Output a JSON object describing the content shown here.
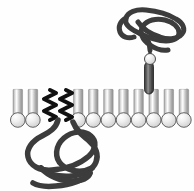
{
  "figure": {
    "width": 194,
    "height": 191,
    "background_color": "#fefefe"
  },
  "membrane": {
    "label": "phospholipid-bilayer",
    "left_x": 10,
    "right_x": 186,
    "top_y": 52,
    "bottom_y": 128,
    "midline_y": 88,
    "lipid_spacing": 15.1,
    "lipid_count_per_leaflet": 12,
    "head_radius": 7.3,
    "head_fill": "#e8e8e8",
    "head_edge": "#555555",
    "tail_fill": "#b9b9b9",
    "tail_edge": "#8a8a8a",
    "tail_width": 9.5,
    "outer_leaflet_head_y": 60,
    "inner_leaflet_head_y": 120,
    "outer_leaflet_omitted_index": 9,
    "inner_leaflet_omitted_indices": [
      2,
      3
    ]
  },
  "proteins": [
    {
      "name": "transmembrane-protein",
      "side": "extracellular",
      "stroke_color": "#3c3c3c",
      "stroke_width": 5,
      "globular_domain_label": "tangled-globular-domain",
      "transmembrane_domain": {
        "label": "transmembrane-helix",
        "center_x": 149,
        "top_y": 62,
        "bottom_y": 94,
        "width": 9,
        "fill": "#3a3a3a",
        "stripe_color": "#9a9a9a",
        "stripe_count": 6
      },
      "linker": {
        "from_x": 150,
        "from_y": 62,
        "to_x": 150,
        "to_y": 50
      },
      "anchor_head": {
        "label": "linker-junction-head",
        "cx": 150,
        "cy": 59,
        "r": 5.5,
        "fill": "#f0f0f0",
        "edge": "#4a4a4a"
      }
    },
    {
      "name": "lipid-anchored-protein",
      "side": "cytoplasmic",
      "stroke_color": "#3c3c3c",
      "stroke_width": 5.5,
      "globular_domain_label": "tangled-globular-domain",
      "acyl_anchors": {
        "label": "zigzag-acyl-chains",
        "count": 2,
        "color": "#111111",
        "stroke_width": 4,
        "chain_x": [
          50,
          66
        ],
        "top_y": 90,
        "bottom_y": 120,
        "zigzag_amplitude": 6,
        "zigzag_segments": 5
      }
    }
  ],
  "colors": {
    "protein_dark": "#3c3c3c",
    "acyl_black": "#111111",
    "lipid_head_light": "#f2f2f2",
    "lipid_head_mid": "#d9d9d9",
    "lipid_tail_gray": "#b5b5b5",
    "tmd_dark": "#3a3a3a"
  }
}
